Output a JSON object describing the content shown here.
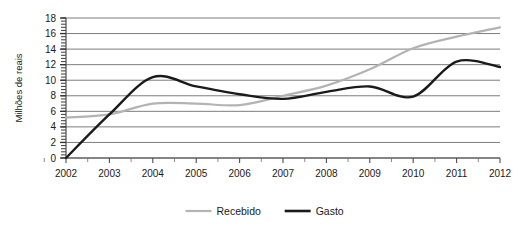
{
  "chart_data": {
    "type": "line",
    "title": "",
    "subtitle": "",
    "xlabel": "",
    "ylabel": "Milhões de reais",
    "xlim": [
      2002,
      2012
    ],
    "ylim": [
      0,
      18
    ],
    "y_ticks": [
      0,
      2,
      4,
      6,
      8,
      10,
      12,
      14,
      16,
      18
    ],
    "y_tick_labels": [
      "0",
      "2",
      "4",
      "6",
      "8",
      "10",
      "12",
      "14",
      "16",
      "18"
    ],
    "x_ticks": [
      2002,
      2003,
      2004,
      2005,
      2006,
      2007,
      2008,
      2009,
      2010,
      2011,
      2012
    ],
    "x_tick_labels": [
      "2002",
      "2003",
      "2004",
      "2005",
      "2006",
      "2007",
      "2008",
      "2009",
      "2010",
      "2011",
      "2012"
    ],
    "grid": "horizontal",
    "legend_position": "bottom-center",
    "minor_ticks_axis": "y",
    "categories": [
      2002,
      2003,
      2004,
      2005,
      2006,
      2007,
      2008,
      2009,
      2010,
      2011,
      2012
    ],
    "series": [
      {
        "name": "Recebido",
        "color": "#b3b3b3",
        "line_width": 2.2,
        "values": [
          5.2,
          5.6,
          7.0,
          7.0,
          6.8,
          8.0,
          9.3,
          11.4,
          14.1,
          15.6,
          16.8
        ]
      },
      {
        "name": "Gasto",
        "color": "#1a1a1a",
        "line_width": 2.4,
        "values": [
          0.0,
          5.6,
          10.4,
          9.2,
          8.2,
          7.6,
          8.5,
          9.2,
          7.9,
          12.4,
          11.7
        ]
      }
    ],
    "annotations": []
  },
  "legend": {
    "items": [
      {
        "label": "Recebido",
        "color": "#b3b3b3"
      },
      {
        "label": "Gasto",
        "color": "#1a1a1a"
      }
    ]
  },
  "axes": {
    "y_title": "Milhões de reais"
  }
}
